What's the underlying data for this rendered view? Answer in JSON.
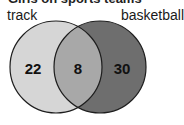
{
  "title": "Girls on sports teams",
  "sets": [
    {
      "name": "track",
      "color": "#d6d6d6"
    },
    {
      "name": "basketball",
      "color": "#6e6e6e"
    }
  ],
  "intersection_color": "#a8a8a8",
  "outline_color": "#1e1e1e",
  "regions": {
    "only_a": "22",
    "both": "8",
    "only_b": "30"
  }
}
